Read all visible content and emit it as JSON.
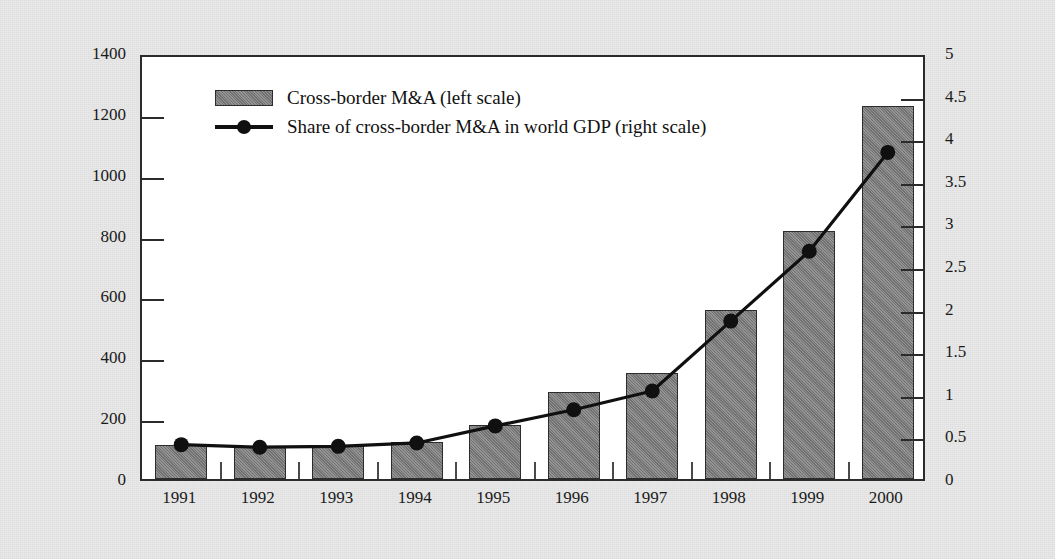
{
  "chart_data": {
    "type": "bar",
    "title": "",
    "subtitle": "",
    "categories": [
      "1991",
      "1992",
      "1993",
      "1994",
      "1995",
      "1996",
      "1997",
      "1998",
      "1999",
      "2000"
    ],
    "xlabel": "",
    "ylabel": "Billions of U.S. dollars",
    "y2label": "Percent",
    "ylim": [
      0,
      1400
    ],
    "y2lim": [
      0,
      5
    ],
    "yticks": [
      "0",
      "200",
      "400",
      "600",
      "800",
      "1000",
      "1200",
      "1400"
    ],
    "y2ticks": [
      "0",
      "0.5",
      "1",
      "1.5",
      "2",
      "2.5",
      "3",
      "3.5",
      "4",
      "4.5",
      "5"
    ],
    "grid": false,
    "legend_position": "upper-left-inside",
    "series": [
      {
        "name": "Cross-border M&A (left scale)",
        "type": "bar",
        "axis": "left",
        "color": "#7e7e7e",
        "values": [
          113,
          110,
          110,
          122,
          177,
          285,
          347,
          555,
          815,
          1225
        ]
      },
      {
        "name": "Share of cross-border M&A in world GDP (right scale)",
        "type": "line",
        "axis": "right",
        "color": "#101010",
        "marker": "circle",
        "values": [
          0.45,
          0.42,
          0.43,
          0.47,
          0.67,
          0.86,
          1.08,
          1.9,
          2.72,
          3.88
        ]
      }
    ]
  },
  "legend": {
    "items": [
      {
        "label": "Cross-border M&A (left scale)",
        "key": "bar-swatch"
      },
      {
        "label": "Share of cross-border M&A in world GDP (right scale)",
        "key": "line-swatch"
      }
    ]
  },
  "axes": {
    "left_title": "Billions of U.S. dollars",
    "right_title": "Percent"
  },
  "colors": {
    "bar_fill": "#7e7e7e",
    "bar_edge": "#2c2c2c",
    "line": "#101010",
    "frame": "#2b2b2b",
    "background": "#e9e9e9",
    "plot_background": "#ffffff"
  }
}
